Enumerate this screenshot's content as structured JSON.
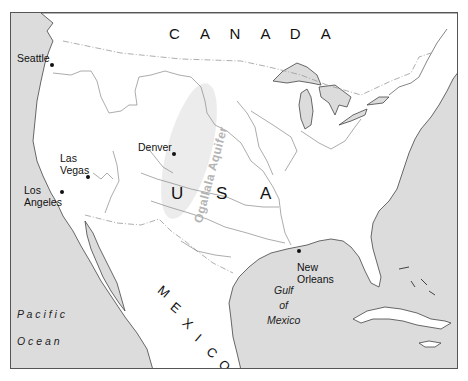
{
  "map": {
    "colors": {
      "land": "#ffffff",
      "water": "#dcdcdc",
      "border": "#555555",
      "river": "#777777",
      "aquifer_text": "#b4b4b4",
      "aquifer_shade": "#ececec"
    },
    "countries": [
      {
        "name": "CANADA",
        "letters": [
          "C",
          "A",
          "N",
          "A",
          "D",
          "A"
        ]
      },
      {
        "name": "USA",
        "letters": [
          "U",
          "S",
          "A"
        ]
      },
      {
        "name": "MEXICO",
        "letters": [
          "M",
          "E",
          "X",
          "I",
          "C",
          "O"
        ]
      }
    ],
    "cities": [
      {
        "name": "Seattle"
      },
      {
        "name": "Denver"
      },
      {
        "name": "Las Vegas",
        "lines": [
          "Las",
          "Vegas"
        ]
      },
      {
        "name": "Los Angeles",
        "lines": [
          "Los",
          "Angeles"
        ]
      },
      {
        "name": "New Orleans",
        "lines": [
          "New",
          "Orleans"
        ]
      }
    ],
    "water_bodies": [
      {
        "name": "Pacific Ocean",
        "lines": [
          "P a c i f i c",
          "O c e a n"
        ]
      },
      {
        "name": "Gulf of Mexico",
        "lines": [
          "Gulf",
          "of",
          "Mexico"
        ]
      }
    ],
    "features": [
      {
        "name": "Ogallala Aquifer"
      }
    ]
  }
}
